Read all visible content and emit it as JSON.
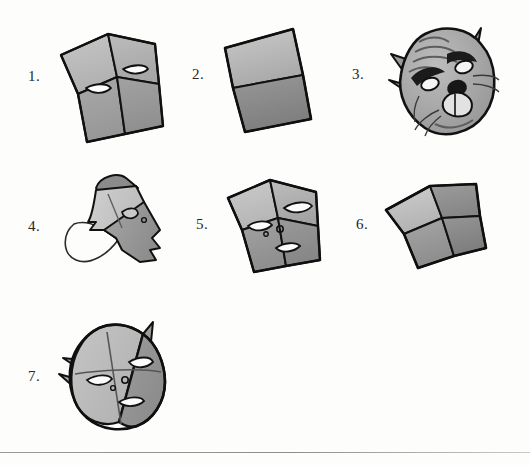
{
  "page": {
    "background_color": "#fdfdfc",
    "width": 530,
    "height": 465,
    "rule": {
      "y": 452,
      "color": "#8e8e8e"
    }
  },
  "palette": {
    "ink": "#1a1a1a",
    "outline": "#111111",
    "paper_light": "#c3c3c3",
    "paper_mid": "#a8a8a8",
    "paper_dark": "#8d8d8d",
    "paper_darkest": "#767676",
    "highlight": "#d7d7d7",
    "white": "#ffffff"
  },
  "steps": [
    {
      "id": "step-1",
      "label": "1.",
      "label_x": 28,
      "label_y": 68,
      "figure_x": 55,
      "figure_y": 22,
      "caption": "Folded square sheet with two eye slits cut near the centre fold",
      "kind": "folded-square-with-eyes"
    },
    {
      "id": "step-2",
      "label": "2.",
      "label_x": 192,
      "label_y": 66,
      "figure_x": 215,
      "figure_y": 20,
      "caption": "Square folded in half horizontally, lower half shaded darker",
      "kind": "half-folded-square"
    },
    {
      "id": "step-3",
      "label": "3.",
      "label_x": 352,
      "label_y": 66,
      "figure_x": 385,
      "figure_y": 18,
      "caption": "Finished cat mask with ears, whiskers, eyes, nose and muzzle",
      "kind": "cat-face"
    },
    {
      "id": "step-4",
      "label": "4.",
      "label_x": 28,
      "label_y": 218,
      "figure_x": 60,
      "figure_y": 168,
      "caption": "Rolled cone shape with outlined flap showing the unfolding move",
      "kind": "rolled-cone"
    },
    {
      "id": "step-5",
      "label": "5.",
      "label_x": 196,
      "label_y": 216,
      "figure_x": 222,
      "figure_y": 168,
      "caption": "Square with quarter folds, two eye slits, a nostril dot and a mouth slit",
      "kind": "quartered-square-face"
    },
    {
      "id": "step-6",
      "label": "6.",
      "label_x": 356,
      "label_y": 216,
      "figure_x": 380,
      "figure_y": 172,
      "caption": "Square folded into four quarters, shaded in four tones",
      "kind": "quartered-square"
    },
    {
      "id": "step-7",
      "label": "7.",
      "label_x": 28,
      "label_y": 368,
      "figure_x": 55,
      "figure_y": 318,
      "caption": "Rounded mask with pointed ears, eye slits, nostril dot and mouth slit",
      "kind": "rounded-mask-face"
    }
  ]
}
